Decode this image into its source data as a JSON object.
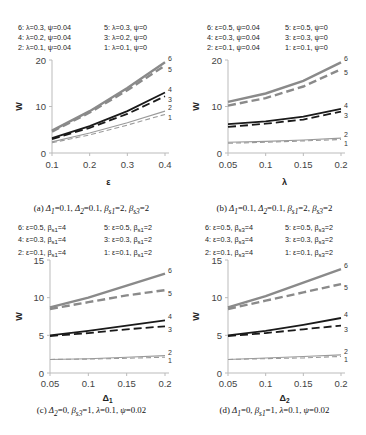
{
  "chart_data": [
    {
      "id": "a",
      "type": "line",
      "title": "",
      "caption": "(a) Δ1=0.1, Δ2=0.1, βs1=2, βs3=2",
      "xlabel": "ε",
      "ylabel": "W",
      "x": [
        0.1,
        0.2,
        0.3,
        0.4
      ],
      "xticks": [
        "0.1",
        "0.2",
        "0.3",
        "0.4"
      ],
      "yticks": [
        "0",
        "10",
        "20"
      ],
      "ylim": [
        0,
        20
      ],
      "xlim": [
        0.1,
        0.4
      ],
      "legend": [
        "6: λ=0.3, ψ=0.04",
        "5: λ=0.3, ψ=0",
        "4: λ=0.2, ψ=0.04",
        "3: λ=0.2, ψ=0",
        "2: λ=0.1, ψ=0.04",
        "1: λ=0.1, ψ=0"
      ],
      "series": [
        {
          "name": "6: λ=0.3, ψ=0.04",
          "label": "6",
          "values": [
            4.8,
            9.0,
            14.0,
            19.5
          ]
        },
        {
          "name": "5: λ=0.3, ψ=0",
          "label": "5",
          "values": [
            4.6,
            8.7,
            13.5,
            18.8
          ]
        },
        {
          "name": "4: λ=0.2, ψ=0.04",
          "label": "4",
          "values": [
            3.2,
            5.8,
            9.0,
            13.0
          ]
        },
        {
          "name": "3: λ=0.2, ψ=0",
          "label": "3",
          "values": [
            3.0,
            5.4,
            8.4,
            12.2
          ]
        },
        {
          "name": "2: λ=0.1, ψ=0.04",
          "label": "2",
          "values": [
            2.4,
            4.3,
            6.5,
            9.0
          ]
        },
        {
          "name": "1: λ=0.1, ψ=0",
          "label": "1",
          "values": [
            2.2,
            3.9,
            6.0,
            8.3
          ]
        }
      ]
    },
    {
      "id": "b",
      "type": "line",
      "title": "",
      "caption": "(b) Δ1=0.1, Δ2=0.1, βs1=2, βs3=2",
      "xlabel": "λ",
      "ylabel": "W",
      "x": [
        0.05,
        0.1,
        0.15,
        0.2
      ],
      "xticks": [
        "0.05",
        "0.1",
        "0.15",
        "0.2"
      ],
      "yticks": [
        "0",
        "10",
        "20"
      ],
      "ylim": [
        0,
        20
      ],
      "xlim": [
        0.05,
        0.2
      ],
      "legend": [
        "6: ε=0.5, ψ=0.04",
        "5: ε=0.5, ψ=0",
        "4: ε=0.3, ψ=0.04",
        "3: ε=0.3, ψ=0",
        "2: ε=0.1, ψ=0.04",
        "1: ε=0.1, ψ=0"
      ],
      "series": [
        {
          "name": "6: ε=0.5, ψ=0.04",
          "label": "6",
          "values": [
            11.0,
            12.8,
            15.5,
            19.5
          ]
        },
        {
          "name": "5: ε=0.5, ψ=0",
          "label": "5",
          "values": [
            10.2,
            11.8,
            14.3,
            18.0
          ]
        },
        {
          "name": "4: ε=0.3, ψ=0.04",
          "label": "4",
          "values": [
            6.2,
            6.8,
            7.8,
            9.5
          ]
        },
        {
          "name": "3: ε=0.3, ψ=0",
          "label": "3",
          "values": [
            5.6,
            6.3,
            7.2,
            8.9
          ]
        },
        {
          "name": "2: ε=0.1, ψ=0.04",
          "label": "2",
          "values": [
            2.3,
            2.5,
            2.8,
            3.2
          ]
        },
        {
          "name": "1: ε=0.1, ψ=0",
          "label": "1",
          "values": [
            2.1,
            2.3,
            2.6,
            2.9
          ]
        }
      ]
    },
    {
      "id": "c",
      "type": "line",
      "title": "",
      "caption": "(c) Δ2=0, βs3=1, λ=0.1, ψ=0.02",
      "xlabel": "Δ1",
      "ylabel": "W",
      "x": [
        0.05,
        0.1,
        0.15,
        0.2
      ],
      "xticks": [
        "0.05",
        "0.1",
        "0.15",
        "0.2"
      ],
      "yticks": [
        "0",
        "5",
        "10",
        "15"
      ],
      "ylim": [
        0,
        15
      ],
      "xlim": [
        0.05,
        0.2
      ],
      "legend": [
        "6: ε=0.5, βs1=4",
        "5: ε=0.5, βs1=2",
        "4: ε=0.3, βs1=4",
        "3: ε=0.3, βs1=2",
        "2: ε=0.1, βs1=4",
        "1: ε=0.1, βs1=2"
      ],
      "series": [
        {
          "name": "6: ε=0.5, βs1=4",
          "label": "6",
          "values": [
            8.7,
            10.0,
            11.6,
            13.2
          ]
        },
        {
          "name": "5: ε=0.5, βs1=2",
          "label": "5",
          "values": [
            8.5,
            9.4,
            10.3,
            11.0
          ]
        },
        {
          "name": "4: ε=0.3, βs1=4",
          "label": "4",
          "values": [
            5.0,
            5.6,
            6.3,
            7.0
          ]
        },
        {
          "name": "3: ε=0.3, βs1=2",
          "label": "3",
          "values": [
            4.9,
            5.3,
            5.8,
            6.2
          ]
        },
        {
          "name": "2: ε=0.1, βs1=4",
          "label": "2",
          "values": [
            1.8,
            1.9,
            2.1,
            2.3
          ]
        },
        {
          "name": "1: ε=0.1, βs1=2",
          "label": "1",
          "values": [
            1.8,
            1.85,
            1.95,
            2.1
          ]
        }
      ]
    },
    {
      "id": "d",
      "type": "line",
      "title": "",
      "caption": "(d) Δ1=0, βs1=1, λ=0.1, ψ=0.02",
      "xlabel": "Δ2",
      "ylabel": "W",
      "x": [
        0.05,
        0.1,
        0.15,
        0.2
      ],
      "xticks": [
        "0.05",
        "0.1",
        "0.15",
        "0.2"
      ],
      "yticks": [
        "0",
        "5",
        "10",
        "15"
      ],
      "ylim": [
        0,
        15
      ],
      "xlim": [
        0.05,
        0.2
      ],
      "legend": [
        "6: ε=0.5, βs3=4",
        "5: ε=0.5, βs3=2",
        "4: ε=0.3, βs3=4",
        "3: ε=0.3, βs3=2",
        "2: ε=0.1, βs3=4",
        "1: ε=0.1, βs3=2"
      ],
      "series": [
        {
          "name": "6: ε=0.5, βs3=4",
          "label": "6",
          "values": [
            8.7,
            10.2,
            12.0,
            13.8
          ]
        },
        {
          "name": "5: ε=0.5, βs3=2",
          "label": "5",
          "values": [
            8.5,
            9.6,
            10.7,
            11.8
          ]
        },
        {
          "name": "4: ε=0.3, βs3=4",
          "label": "4",
          "values": [
            5.0,
            5.6,
            6.4,
            7.3
          ]
        },
        {
          "name": "3: ε=0.3, βs3=2",
          "label": "3",
          "values": [
            4.9,
            5.3,
            5.8,
            6.3
          ]
        },
        {
          "name": "2: ε=0.1, βs3=4",
          "label": "2",
          "values": [
            1.8,
            2.0,
            2.2,
            2.4
          ]
        },
        {
          "name": "1: ε=0.1, βs3=2",
          "label": "1",
          "values": [
            1.8,
            1.9,
            2.0,
            2.2
          ]
        }
      ]
    }
  ],
  "panels": {
    "a": {
      "legend": {
        "l6": "6: λ=0.3, ψ=0.04",
        "l5": "5: λ=0.3, ψ=0",
        "l4": "4: λ=0.2, ψ=0.04",
        "l3": "3: λ=0.2, ψ=0",
        "l2": "2: λ=0.1, ψ=0.04",
        "l1": "1: λ=0.1, ψ=0"
      },
      "caption": {
        "prefix": "(a) ",
        "d1": "Δ",
        "s1": "1",
        "t1": "=0.1, ",
        "d2": "Δ",
        "s2": "2",
        "t2": "=0.1, ",
        "b1": "β",
        "bs1": "s1",
        "t3": "=2, ",
        "b2": "β",
        "bs2": "s3",
        "t4": "=2"
      }
    },
    "b": {
      "legend": {
        "l6": "6: ε=0.5, ψ=0.04",
        "l5": "5: ε=0.5, ψ=0",
        "l4": "4: ε=0.3, ψ=0.04",
        "l3": "3: ε=0.3, ψ=0",
        "l2": "2: ε=0.1, ψ=0.04",
        "l1": "1: ε=0.1, ψ=0"
      },
      "caption": {
        "prefix": "(b) ",
        "d1": "Δ",
        "s1": "1",
        "t1": "=0.1, ",
        "d2": "Δ",
        "s2": "2",
        "t2": "=0.1, ",
        "b1": "β",
        "bs1": "s1",
        "t3": "=2, ",
        "b2": "β",
        "bs2": "s3",
        "t4": "=2"
      }
    },
    "c": {
      "legend": {
        "l6": "6: ε=0.5, β",
        "l6s": "s1",
        "l6t": "=4",
        "l5": "5: ε=0.5, β",
        "l5s": "s1",
        "l5t": "=2",
        "l4": "4: ε=0.3, β",
        "l4s": "s1",
        "l4t": "=4",
        "l3": "3: ε=0.3, β",
        "l3s": "s1",
        "l3t": "=2",
        "l2": "2: ε=0.1, β",
        "l2s": "s1",
        "l2t": "=4",
        "l1": "1: ε=0.1, β",
        "l1s": "s1",
        "l1t": "=2"
      },
      "caption": {
        "prefix": "(c) ",
        "d1": "Δ",
        "s1": "2",
        "t1": "=0, ",
        "b1": "β",
        "bs1": "s3",
        "t2": "=1, ",
        "lam": "λ",
        "t3": "=0.1, ",
        "psi": "ψ",
        "t4": "=0.02"
      }
    },
    "d": {
      "legend": {
        "l6": "6: ε=0.5, β",
        "l6s": "s3",
        "l6t": "=4",
        "l5": "5: ε=0.5, β",
        "l5s": "s3",
        "l5t": "=2",
        "l4": "4: ε=0.3, β",
        "l4s": "s3",
        "l4t": "=4",
        "l3": "3: ε=0.3, β",
        "l3s": "s3",
        "l3t": "=2",
        "l2": "2: ε=0.1, β",
        "l2s": "s3",
        "l2t": "=4",
        "l1": "1: ε=0.1, β",
        "l1s": "s3",
        "l1t": "=2"
      },
      "caption": {
        "prefix": "(d) ",
        "d1": "Δ",
        "s1": "1",
        "t1": "=0, ",
        "b1": "β",
        "bs1": "s1",
        "t2": "=1, ",
        "lam": "λ",
        "t3": "=0.1, ",
        "psi": "ψ",
        "t4": "=0.02"
      }
    }
  },
  "style": {
    "grey": "#8a8a8a",
    "black": "#1a1a1a",
    "light": "#9a9a9a",
    "axis": "#bbbbbb"
  }
}
